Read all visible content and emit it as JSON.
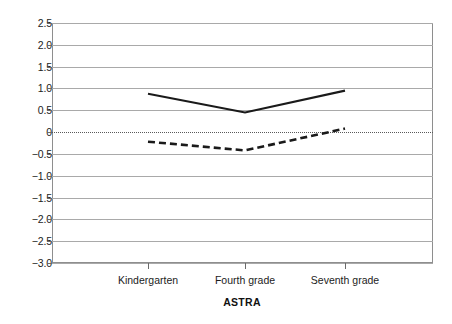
{
  "chart_data": {
    "type": "line",
    "title": "",
    "xlabel": "ASTRA",
    "ylabel": "",
    "categories": [
      "Kindergarten",
      "Fourth grade",
      "Seventh grade"
    ],
    "series": [
      {
        "name": "solid-line",
        "style": "solid",
        "color": "#1a1a1a",
        "values": [
          0.88,
          0.45,
          0.95
        ]
      },
      {
        "name": "dashed-line",
        "style": "dashed",
        "color": "#1a1a1a",
        "values": [
          -0.22,
          -0.42,
          0.08
        ]
      }
    ],
    "ylim": [
      -3.0,
      2.5
    ],
    "ytick_values": [
      2.5,
      2.0,
      1.5,
      1.0,
      0.5,
      0,
      -0.5,
      -1.0,
      -1.5,
      -2.0,
      -2.5,
      -3.0
    ],
    "ytick_labels": [
      "2.5",
      "2.0",
      "1.5",
      "1.0",
      "0.5",
      "0",
      "−0.5",
      "−1.0",
      "−1.5",
      "−2.0",
      "−2.5",
      "−3.0"
    ],
    "grid": true,
    "zero_line": true,
    "zero_line_style": "dotted",
    "legend": "none",
    "frame_color": "#8e8e8e",
    "grid_color": "#a9a9a9",
    "background": "#ffffff"
  },
  "yticks": [
    {
      "label": "2.5"
    },
    {
      "label": "2.0"
    },
    {
      "label": "1.5"
    },
    {
      "label": "1.0"
    },
    {
      "label": "0.5"
    },
    {
      "label": "0"
    },
    {
      "label": "−0.5"
    },
    {
      "label": "−1.0"
    },
    {
      "label": "−1.5"
    },
    {
      "label": "−2.0"
    },
    {
      "label": "−2.5"
    },
    {
      "label": "−3.0"
    }
  ],
  "xticks": [
    {
      "label": "Kindergarten"
    },
    {
      "label": "Fourth grade"
    },
    {
      "label": "Seventh grade"
    }
  ],
  "axis_titles": {
    "x": "ASTRA"
  }
}
